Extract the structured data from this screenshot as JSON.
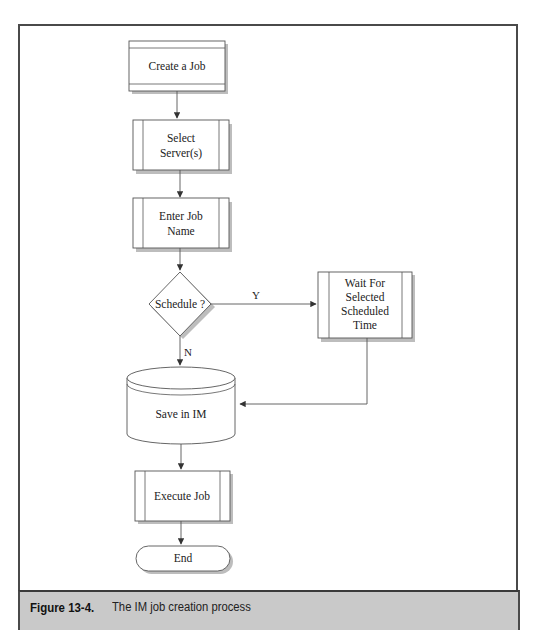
{
  "figure": {
    "label": "Figure 13-4.",
    "caption": "The IM job creation process"
  },
  "nodes": {
    "create_job": {
      "shape": "process-with-bars",
      "lines": [
        "Create a Job"
      ]
    },
    "select_servers": {
      "shape": "predefined-process",
      "lines": [
        "Select",
        "Server(s)"
      ]
    },
    "enter_job_name": {
      "shape": "predefined-process",
      "lines": [
        "Enter Job",
        "Name"
      ]
    },
    "schedule": {
      "shape": "decision",
      "lines": [
        "Schedule ?"
      ]
    },
    "wait_for_time": {
      "shape": "predefined-process",
      "lines": [
        "Wait For",
        "Selected",
        "Scheduled",
        "Time"
      ]
    },
    "save_in_im": {
      "shape": "database",
      "lines": [
        "Save in IM"
      ]
    },
    "execute_job": {
      "shape": "predefined-process",
      "lines": [
        "Execute Job"
      ]
    },
    "end": {
      "shape": "terminator",
      "lines": [
        "End"
      ]
    }
  },
  "edges": [
    {
      "from": "create_job",
      "to": "select_servers",
      "label": ""
    },
    {
      "from": "select_servers",
      "to": "enter_job_name",
      "label": ""
    },
    {
      "from": "enter_job_name",
      "to": "schedule",
      "label": ""
    },
    {
      "from": "schedule",
      "to": "wait_for_time",
      "label": "Y"
    },
    {
      "from": "schedule",
      "to": "save_in_im",
      "label": "N"
    },
    {
      "from": "wait_for_time",
      "to": "save_in_im",
      "label": ""
    },
    {
      "from": "save_in_im",
      "to": "execute_job",
      "label": ""
    },
    {
      "from": "execute_job",
      "to": "end",
      "label": ""
    }
  ],
  "labels": {
    "yes": "Y",
    "no": "N"
  },
  "colors": {
    "stroke": "#555555",
    "shadow": "#b5b5b5",
    "caption_bg": "#c9c9c9",
    "frame": "#4a4a4a"
  }
}
